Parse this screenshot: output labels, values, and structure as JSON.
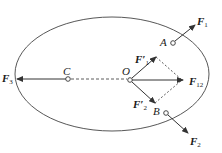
{
  "diagram": {
    "type": "force diagram on rigid body",
    "colors": {
      "stroke": "#333333",
      "text": "#1a1a1a",
      "background": "#ffffff"
    },
    "points": {
      "A": {
        "label": "A"
      },
      "B": {
        "label": "B"
      },
      "C": {
        "label": "C"
      },
      "O": {
        "label": "O"
      }
    },
    "forces": {
      "F1": {
        "symbol": "F",
        "sub": "1",
        "prime": ""
      },
      "F2": {
        "symbol": "F",
        "sub": "2",
        "prime": ""
      },
      "F3": {
        "symbol": "F",
        "sub": "3",
        "prime": ""
      },
      "F1p": {
        "symbol": "F",
        "sub": "1",
        "prime": "′"
      },
      "F2p": {
        "symbol": "F",
        "sub": "2",
        "prime": "′"
      },
      "F12": {
        "symbol": "F",
        "sub": "12",
        "prime": ""
      }
    }
  }
}
